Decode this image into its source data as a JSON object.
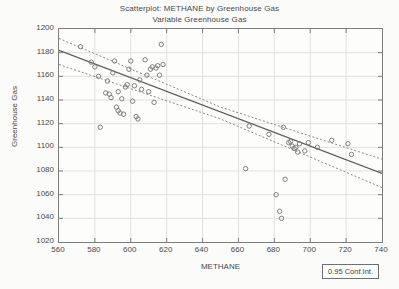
{
  "chart_data": {
    "type": "scatter",
    "title": "Scatterplot: METHANE by Greenhouse Gas",
    "subtitle": "Variable Greenhouse Gas",
    "xlabel": "METHANE",
    "ylabel": "Greenhouse Gas",
    "xlim": [
      560,
      740
    ],
    "ylim": [
      1020,
      1200
    ],
    "xticks": [
      560,
      580,
      600,
      620,
      640,
      660,
      680,
      700,
      720,
      740
    ],
    "yticks": [
      1020,
      1040,
      1060,
      1080,
      1100,
      1120,
      1140,
      1160,
      1180,
      1200
    ],
    "grid": true,
    "legend_position": "bottom-right",
    "legend_label": "0.95 Conf.Int.",
    "marker": "open-circle",
    "marker_color": "#808080",
    "fit_line_color": "#5a5a5a",
    "conf_band_color": "#8a8a8a",
    "grid_color": "#e0e0e0",
    "axis_color": "#7d7d7d",
    "background_color": "#fdfdfc",
    "page_background": "#fbfbfa",
    "text_color": "#4a4a4a",
    "fit_line": {
      "x": [
        560,
        740
      ],
      "y": [
        1182,
        1078
      ]
    },
    "conf_upper": {
      "x": [
        560,
        650,
        740
      ],
      "y": [
        1192,
        1134,
        1090
      ]
    },
    "conf_lower": {
      "x": [
        560,
        650,
        740
      ],
      "y": [
        1170,
        1124,
        1066
      ]
    },
    "points": [
      {
        "x": 572,
        "y": 1185
      },
      {
        "x": 578,
        "y": 1172
      },
      {
        "x": 580,
        "y": 1168
      },
      {
        "x": 582,
        "y": 1160
      },
      {
        "x": 583,
        "y": 1117
      },
      {
        "x": 586,
        "y": 1146
      },
      {
        "x": 587,
        "y": 1156
      },
      {
        "x": 588,
        "y": 1145
      },
      {
        "x": 589,
        "y": 1142
      },
      {
        "x": 590,
        "y": 1163
      },
      {
        "x": 591,
        "y": 1173
      },
      {
        "x": 592,
        "y": 1134
      },
      {
        "x": 593,
        "y": 1131
      },
      {
        "x": 593,
        "y": 1147
      },
      {
        "x": 594,
        "y": 1129
      },
      {
        "x": 595,
        "y": 1141
      },
      {
        "x": 596,
        "y": 1128
      },
      {
        "x": 597,
        "y": 1151
      },
      {
        "x": 598,
        "y": 1153
      },
      {
        "x": 599,
        "y": 1166
      },
      {
        "x": 600,
        "y": 1173
      },
      {
        "x": 601,
        "y": 1139
      },
      {
        "x": 602,
        "y": 1152
      },
      {
        "x": 603,
        "y": 1126
      },
      {
        "x": 604,
        "y": 1124
      },
      {
        "x": 605,
        "y": 1157
      },
      {
        "x": 606,
        "y": 1149
      },
      {
        "x": 608,
        "y": 1174
      },
      {
        "x": 609,
        "y": 1161
      },
      {
        "x": 610,
        "y": 1147
      },
      {
        "x": 611,
        "y": 1166
      },
      {
        "x": 612,
        "y": 1168
      },
      {
        "x": 613,
        "y": 1138
      },
      {
        "x": 614,
        "y": 1167
      },
      {
        "x": 615,
        "y": 1169
      },
      {
        "x": 616,
        "y": 1161
      },
      {
        "x": 617,
        "y": 1187
      },
      {
        "x": 618,
        "y": 1170
      },
      {
        "x": 664,
        "y": 1082
      },
      {
        "x": 666,
        "y": 1118
      },
      {
        "x": 677,
        "y": 1111
      },
      {
        "x": 681,
        "y": 1060
      },
      {
        "x": 683,
        "y": 1046
      },
      {
        "x": 684,
        "y": 1040
      },
      {
        "x": 685,
        "y": 1117
      },
      {
        "x": 686,
        "y": 1073
      },
      {
        "x": 688,
        "y": 1104
      },
      {
        "x": 689,
        "y": 1105
      },
      {
        "x": 690,
        "y": 1101
      },
      {
        "x": 691,
        "y": 1099
      },
      {
        "x": 692,
        "y": 1100
      },
      {
        "x": 693,
        "y": 1096
      },
      {
        "x": 694,
        "y": 1103
      },
      {
        "x": 697,
        "y": 1097
      },
      {
        "x": 699,
        "y": 1104
      },
      {
        "x": 704,
        "y": 1100
      },
      {
        "x": 712,
        "y": 1106
      },
      {
        "x": 721,
        "y": 1103
      },
      {
        "x": 723,
        "y": 1094
      }
    ]
  }
}
